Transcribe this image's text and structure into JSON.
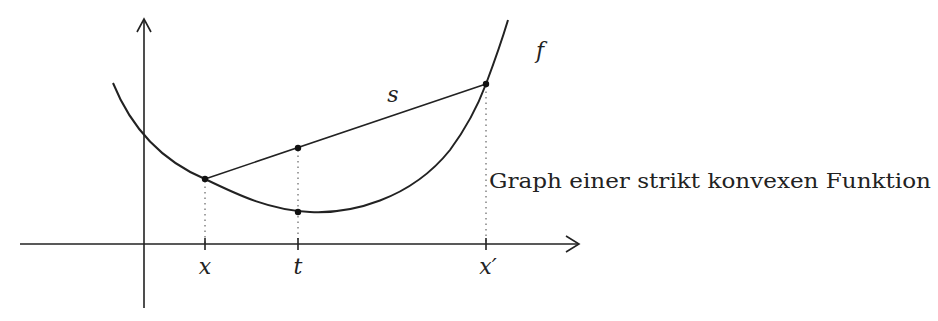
{
  "figure": {
    "caption": "Graph einer strikt konvexen Funktion",
    "function_label": "f",
    "secant_label": "s",
    "ticks": [
      {
        "id": "x",
        "label": "x"
      },
      {
        "id": "t",
        "label": "t"
      },
      {
        "id": "x_prime",
        "label": "x′"
      }
    ],
    "colors": {
      "stroke": "#222222",
      "background": "#ffffff"
    }
  }
}
